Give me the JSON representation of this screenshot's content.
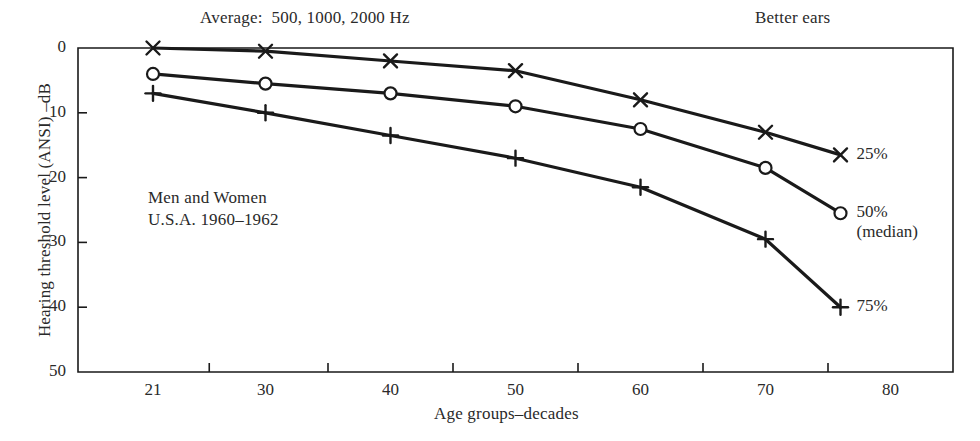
{
  "figure": {
    "header_left": "Average:  500, 1000, 2000 Hz",
    "header_right": "Better ears",
    "annotation_line1": "Men and Women",
    "annotation_line2": "U.S.A. 1960–1962",
    "xlabel": "Age groups–decades",
    "ylabel": "Hearing threshold level (ANSI) –dB",
    "ink_color": "#1a1a1a"
  },
  "chart_data": {
    "type": "line",
    "title": "Average:  500, 1000, 2000 Hz",
    "subtitle": "Better ears",
    "xlabel": "Age groups–decades",
    "ylabel": "Hearing threshold level (ANSI) –dB",
    "annotations": [
      "Men and Women",
      "U.S.A. 1960–1962"
    ],
    "grid": false,
    "legend_position": "right-of-line-ends",
    "y_inverted": true,
    "xlim": [
      15,
      85
    ],
    "ylim": [
      0,
      50
    ],
    "yticks": [
      0,
      10,
      20,
      30,
      40,
      50
    ],
    "ytick_labels": [
      "0",
      "10",
      "20",
      "30",
      "40",
      "50"
    ],
    "xticks": [
      21,
      30,
      40,
      50,
      60,
      70,
      80
    ],
    "xtick_labels": [
      "21",
      "30",
      "40",
      "50",
      "60",
      "70",
      "80"
    ],
    "x": [
      21,
      30,
      40,
      50,
      60,
      70,
      76
    ],
    "series": [
      {
        "name": "25%",
        "label": "25%",
        "marker": "x",
        "values": [
          0,
          0.5,
          2,
          3.5,
          8,
          13,
          16.5
        ]
      },
      {
        "name": "50%",
        "label": "50%",
        "label_sub": "(median)",
        "marker": "o",
        "values": [
          4,
          5.5,
          7,
          9,
          12.5,
          18.5,
          25.5
        ]
      },
      {
        "name": "75%",
        "label": "75%",
        "marker": "+",
        "values": [
          7,
          10,
          13.5,
          17,
          21.5,
          29.5,
          40
        ]
      }
    ]
  }
}
